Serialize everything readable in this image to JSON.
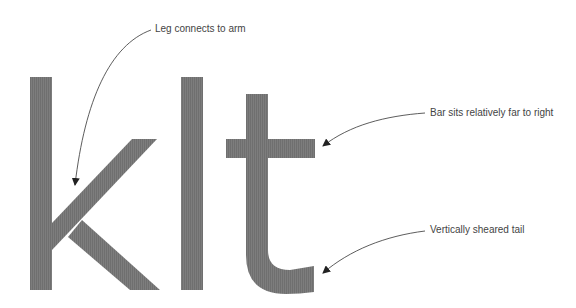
{
  "specimen": {
    "letters": [
      "k",
      "l",
      "t"
    ],
    "glyph_color": "#7a7a7a",
    "background": "#ffffff"
  },
  "annotations": [
    {
      "id": "leg",
      "text": "Leg connects to arm"
    },
    {
      "id": "bar",
      "text": "Bar sits relatively far to right"
    },
    {
      "id": "tail",
      "text": "Vertically sheared tail"
    }
  ],
  "colors": {
    "text": "#444444",
    "arrow": "#333333",
    "glyph": "#7a7a7a"
  }
}
